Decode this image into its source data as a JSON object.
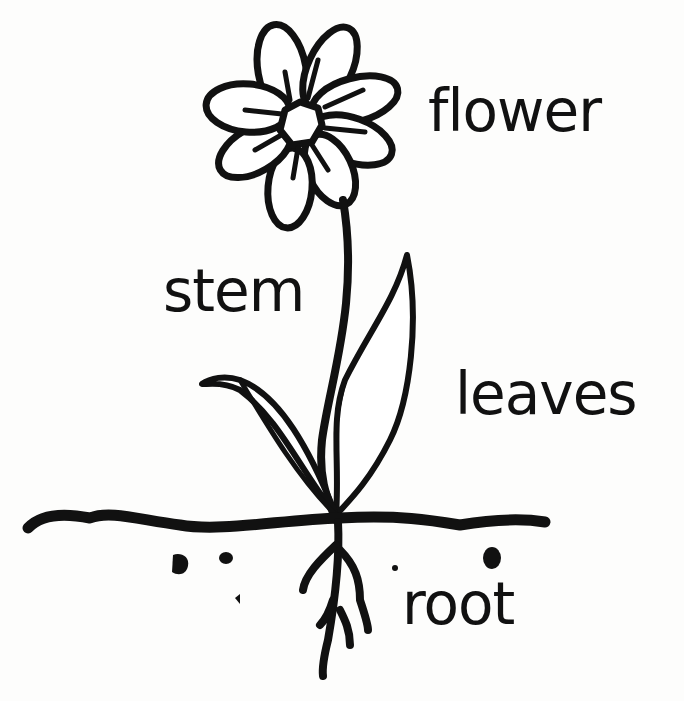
{
  "diagram": {
    "labels": {
      "flower": "flower",
      "stem": "stem",
      "leaves": "leaves",
      "root": "root"
    },
    "colors": {
      "ink": "#111111",
      "paper": "#fdfdfc"
    }
  }
}
